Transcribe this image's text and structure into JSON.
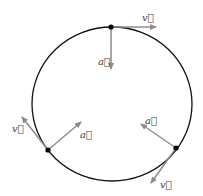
{
  "diagram": {
    "colors": {
      "circle": "#111111",
      "vector": "#8c8c8c",
      "point": "#000000",
      "label": "#444444"
    },
    "points": [
      {
        "name": "top",
        "velocity_label": "v⃗",
        "acceleration_label": "a⃗"
      },
      {
        "name": "lower-left",
        "velocity_label": "v⃗",
        "acceleration_label": "a⃗"
      },
      {
        "name": "lower-right",
        "velocity_label": "v⃗",
        "acceleration_label": "a⃗"
      }
    ]
  }
}
